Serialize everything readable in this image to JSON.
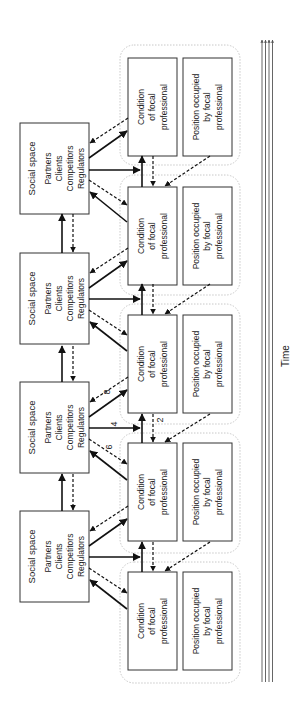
{
  "diagram": {
    "social_space": {
      "title": "Social space",
      "items": [
        "Partners",
        "Clients",
        "Competitors",
        "Regulators"
      ],
      "count": 4
    },
    "condition_box": {
      "lines": [
        "Condition",
        "of focal",
        "professional"
      ]
    },
    "position_box": {
      "lines": [
        "Position occupied",
        "by focal",
        "professional"
      ]
    },
    "group_count": 5,
    "arrow_labels": {
      "up_dashed_between_conditions": "2",
      "horizontal_social_to_condition": "4",
      "diagonal_dashed_social_to_next": "6",
      "diagonal_dashed_condition_to_social": "8"
    },
    "time_axis": {
      "label": "Time",
      "parallel_lines": 4,
      "direction": "up"
    },
    "colors": {
      "stroke": "#111111",
      "box_border": "#333333",
      "group_border": "#c8c8c8",
      "background": "#ffffff"
    }
  }
}
